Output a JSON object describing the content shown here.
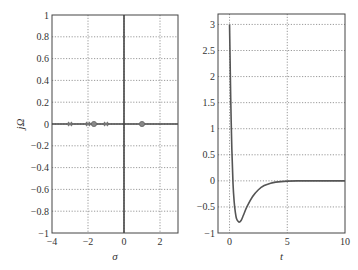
{
  "chart_data": [
    {
      "type": "scatter",
      "title": "",
      "xlabel": "σ",
      "ylabel": "jΩ",
      "xlim": [
        -4,
        3
      ],
      "ylim": [
        -1,
        1
      ],
      "grid": true,
      "xticks": [
        -4,
        -2,
        0,
        2
      ],
      "xtick_labels": [
        "−4",
        "−2",
        "0",
        "2"
      ],
      "yticks": [
        -1,
        -0.8,
        -0.6,
        -0.4,
        -0.2,
        0,
        0.2,
        0.4,
        0.6,
        0.8,
        1
      ],
      "ytick_labels": [
        "−1",
        "−0.8",
        "−0.6",
        "−0.4",
        "−0.2",
        "0",
        "0.2",
        "0.4",
        "0.6",
        "0.8",
        "1"
      ],
      "series": [
        {
          "name": "poles",
          "marker": "x",
          "x": [
            -3,
            -2,
            -1
          ],
          "y": [
            0,
            0,
            0
          ]
        },
        {
          "name": "zeros",
          "marker": "o",
          "x": [
            -1.67,
            1
          ],
          "y": [
            0,
            0
          ]
        }
      ]
    },
    {
      "type": "line",
      "title": "",
      "xlabel": "t",
      "ylabel": "",
      "xlim": [
        -1,
        10
      ],
      "ylim": [
        -1,
        3.2
      ],
      "grid": true,
      "xticks": [
        0,
        5,
        10
      ],
      "xtick_labels": [
        "0",
        "5",
        "10"
      ],
      "yticks": [
        -1,
        -0.5,
        0,
        0.5,
        1,
        1.5,
        2,
        2.5,
        3
      ],
      "ytick_labels": [
        "−1",
        "−0.5",
        "0",
        "0.5",
        "1",
        "1.5",
        "2",
        "2.5",
        "3"
      ],
      "series": [
        {
          "name": "impulse response",
          "x": [
            0,
            0.05,
            0.1,
            0.2,
            0.3,
            0.4,
            0.5,
            0.6,
            0.8,
            1.0,
            1.2,
            1.5,
            2.0,
            2.5,
            3.0,
            3.5,
            4.0,
            5.0,
            6.0,
            8.0,
            10.0
          ],
          "y": [
            3.0,
            2.3,
            1.6,
            0.6,
            -0.05,
            -0.4,
            -0.6,
            -0.72,
            -0.79,
            -0.76,
            -0.66,
            -0.5,
            -0.3,
            -0.17,
            -0.09,
            -0.05,
            -0.025,
            -0.006,
            -0.001,
            0,
            0
          ]
        }
      ]
    }
  ]
}
